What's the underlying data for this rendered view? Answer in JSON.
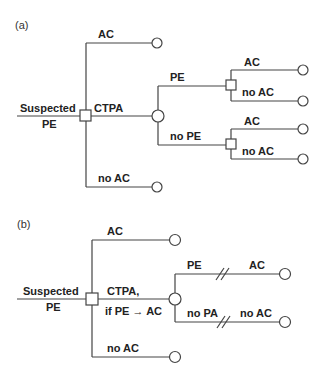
{
  "panel_a": {
    "label": "(a)",
    "root_label_line1": "Suspected",
    "root_label_line2": "PE",
    "branch_top": "AC",
    "branch_mid": "CTPA",
    "branch_bottom": "no AC",
    "chance_up": "PE",
    "chance_down": "no PE",
    "pe_ac": "AC",
    "pe_noac": "no AC",
    "nope_ac": "AC",
    "nope_noac": "no AC"
  },
  "panel_b": {
    "label": "(b)",
    "root_label_line1": "Suspected",
    "root_label_line2": "PE",
    "branch_top": "AC",
    "branch_mid_line1": "CTPA,",
    "branch_mid_line2": "if PE → AC",
    "branch_bottom": "no AC",
    "chance_up": "PE",
    "chance_up_end": "AC",
    "chance_down": "no PA",
    "chance_down_end": "no AC"
  },
  "legend": {
    "decision_node": "square",
    "chance_node": "circle",
    "terminal_node": "circle",
    "break_mark": "double-slash"
  }
}
